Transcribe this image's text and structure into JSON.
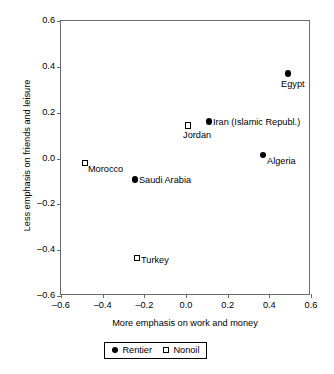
{
  "chart_data": {
    "type": "scatter",
    "title": "",
    "xlabel": "More emphasis on work and money",
    "ylabel": "Less emphasis on friends and leisure",
    "xlim": [
      -0.6,
      0.6
    ],
    "ylim": [
      -0.6,
      0.6
    ],
    "grid": false,
    "legend_position": "bottom-center",
    "xticks": [
      "-0.6",
      "-0.4",
      "-0.2",
      "0.0",
      "0.2",
      "0.4",
      "0.6"
    ],
    "xtick_values": [
      -0.6,
      -0.4,
      -0.2,
      0.0,
      0.2,
      0.4,
      0.6
    ],
    "yticks": [
      "0.6",
      "0.4",
      "0.2",
      "0.0",
      "-0.2",
      "-0.4",
      "-0.6"
    ],
    "ytick_values": [
      0.6,
      0.4,
      0.2,
      0.0,
      -0.2,
      -0.4,
      -0.6
    ],
    "series": [
      {
        "name": "Rentier",
        "marker": "filled-circle",
        "color": "#000000",
        "points": [
          {
            "label": "Egypt",
            "x": 0.49,
            "y": 0.37,
            "label_dx": -7,
            "label_dy": 5
          },
          {
            "label": "Iran (Islamic Republ.)",
            "x": 0.11,
            "y": 0.16,
            "label_dx": 4,
            "label_dy": -5
          },
          {
            "label": "Algeria",
            "x": 0.37,
            "y": 0.015,
            "label_dx": 4,
            "label_dy": 1
          },
          {
            "label": "Saudi Arabia",
            "x": -0.245,
            "y": -0.09,
            "label_dx": 4,
            "label_dy": -4
          }
        ]
      },
      {
        "name": "Nonoil",
        "marker": "open-square",
        "color": "#000000",
        "points": [
          {
            "label": "Jordan",
            "x": 0.01,
            "y": 0.145,
            "label_dx": -5,
            "label_dy": 5
          },
          {
            "label": "Morocco",
            "x": -0.485,
            "y": -0.02,
            "label_dx": 3,
            "label_dy": 1
          },
          {
            "label": "Turkey",
            "x": -0.235,
            "y": -0.435,
            "label_dx": 4,
            "label_dy": -3
          }
        ]
      }
    ],
    "legend": [
      {
        "label": "Rentier",
        "marker": "filled-circle"
      },
      {
        "label": "Nonoil",
        "marker": "open-square"
      }
    ]
  }
}
